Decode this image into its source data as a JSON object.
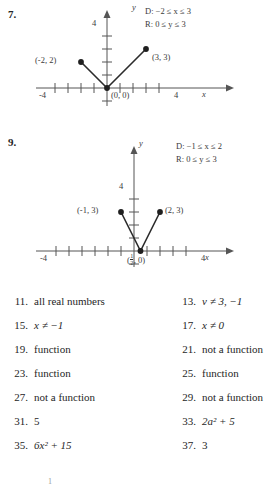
{
  "page": {
    "folio": "1",
    "background": "#ffffff",
    "ink": "#262626"
  },
  "problems": [
    {
      "number": "7.",
      "graph": {
        "type": "line",
        "shape": "absolute-value-v",
        "title": "",
        "xlabel": "x",
        "ylabel": "y",
        "xlim": [
          -5.2,
          5.6
        ],
        "ylim": [
          -1.6,
          4.8
        ],
        "grid": false,
        "x_ticks": [
          -4,
          -3,
          -2,
          -1,
          1,
          2,
          3,
          4
        ],
        "y_ticks": [
          1,
          2,
          3,
          4
        ],
        "x_tick_labels": [
          {
            "value": -4,
            "label": "-4"
          },
          {
            "value": 4,
            "label": "4"
          }
        ],
        "y_tick_labels": [
          {
            "value": 4,
            "label": "4"
          }
        ],
        "series": [
          {
            "name": "left branch",
            "x": [
              -2,
              0
            ],
            "y": [
              2,
              0
            ]
          },
          {
            "name": "right branch",
            "x": [
              0,
              3
            ],
            "y": [
              0,
              3
            ]
          }
        ],
        "points": [
          {
            "x": -2,
            "y": 2,
            "label": "(-2, 2)",
            "label_pos": "left",
            "filled": true
          },
          {
            "x": 0,
            "y": 0,
            "label": "(0, 0)",
            "label_pos": "below-right",
            "filled": true
          },
          {
            "x": 3,
            "y": 3,
            "label": "(3, 3)",
            "label_pos": "below-right",
            "filled": true
          }
        ],
        "annotations": {
          "domain": "D: −2 ≤ x ≤ 3",
          "range": "R: 0 ≤ y ≤ 3"
        }
      }
    },
    {
      "number": "9.",
      "graph": {
        "type": "line",
        "shape": "absolute-value-v",
        "title": "",
        "xlabel": "x",
        "ylabel": "y",
        "xlim": [
          -5.2,
          5.6
        ],
        "ylim": [
          -1.6,
          4.8
        ],
        "grid": false,
        "x_ticks": [
          -4,
          -3,
          -2,
          -1,
          1,
          2,
          3,
          4
        ],
        "y_ticks": [
          1,
          2,
          3,
          4
        ],
        "x_tick_labels": [
          {
            "value": -4,
            "label": "-4"
          },
          {
            "value": 4,
            "label": "4"
          }
        ],
        "y_tick_labels": [
          {
            "value": 4,
            "label": "4"
          }
        ],
        "series": [
          {
            "name": "left branch",
            "x": [
              -1,
              0.5
            ],
            "y": [
              3,
              0
            ]
          },
          {
            "name": "right branch",
            "x": [
              0.5,
              2
            ],
            "y": [
              0,
              3
            ]
          }
        ],
        "points": [
          {
            "x": -1,
            "y": 3,
            "label": "(-1, 3)",
            "label_pos": "left",
            "filled": true
          },
          {
            "x": 0.5,
            "y": 0,
            "label_fraction": true,
            "label_prefix": "(",
            "label_num": "1",
            "label_den": "2",
            "label_suffix": ", 0)",
            "label_pos": "below",
            "filled": true
          },
          {
            "x": 2,
            "y": 3,
            "label": "(2, 3)",
            "label_pos": "right",
            "filled": true
          }
        ],
        "annotations": {
          "domain": "D: −1 ≤ x ≤ 2",
          "range": "R: 0 ≤ y ≤ 3"
        }
      }
    }
  ],
  "answers": {
    "rows": [
      {
        "left": {
          "num": "11.",
          "text": "all real numbers"
        },
        "right": {
          "num": "13.",
          "text": "v ≠ 3, −1",
          "italic_lead": "v"
        }
      },
      {
        "left": {
          "num": "15.",
          "text": "x ≠ −1",
          "italic_lead": "x"
        },
        "right": {
          "num": "17.",
          "text": "x ≠ 0",
          "italic_lead": "x"
        }
      },
      {
        "left": {
          "num": "19.",
          "text": "function"
        },
        "right": {
          "num": "21.",
          "text": "not a function"
        }
      },
      {
        "left": {
          "num": "23.",
          "text": "function"
        },
        "right": {
          "num": "25.",
          "text": "function"
        }
      },
      {
        "left": {
          "num": "27.",
          "text": "not a function"
        },
        "right": {
          "num": "29.",
          "text": "not a function"
        }
      },
      {
        "left": {
          "num": "31.",
          "text": "5"
        },
        "right": {
          "num": "33.",
          "text": "2a² + 5"
        }
      },
      {
        "left": {
          "num": "35.",
          "text": "6x² + 15"
        },
        "right": {
          "num": "37.",
          "text": "3"
        }
      }
    ]
  }
}
